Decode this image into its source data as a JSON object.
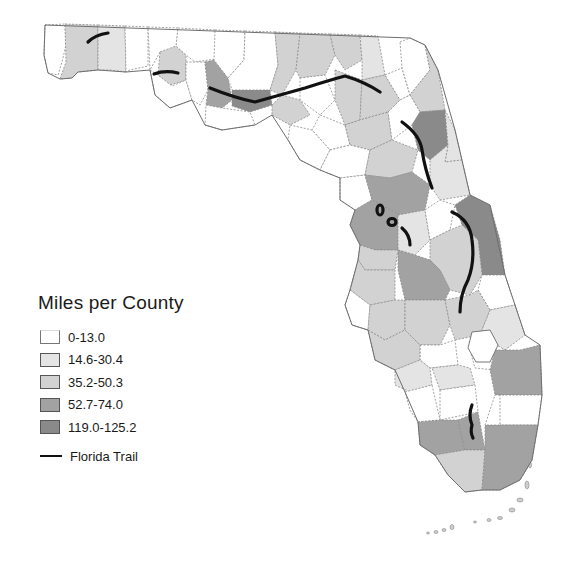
{
  "legend": {
    "title": "Miles per County",
    "classes": [
      {
        "label": "0-13.0",
        "color": "#ffffff"
      },
      {
        "label": "14.6-30.4",
        "color": "#e4e4e4"
      },
      {
        "label": "35.2-50.3",
        "color": "#d2d2d2"
      },
      {
        "label": "52.7-74.0",
        "color": "#a2a2a2"
      },
      {
        "label": "119.0-125.2",
        "color": "#8a8a8a"
      }
    ],
    "trail_label": "Florida Trail",
    "trail_color": "#111111"
  },
  "map": {
    "subject": "Florida",
    "measure": "Florida Trail miles per county"
  }
}
